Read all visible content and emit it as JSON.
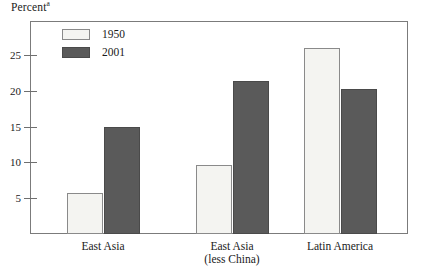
{
  "chart_data": {
    "type": "bar",
    "title": "",
    "ylabel": "Percent",
    "ylabel_superscript": "a",
    "xlabel": "",
    "categories": [
      "East Asia",
      "East Asia (less China)",
      "Latin America"
    ],
    "category_lines": [
      [
        "East Asia"
      ],
      [
        "East Asia",
        "(less China)"
      ],
      [
        "Latin America"
      ]
    ],
    "series": [
      {
        "name": "1950",
        "color": "#f4f4f1",
        "values": [
          5.7,
          9.6,
          26.0
        ]
      },
      {
        "name": "2001",
        "color": "#5a5a5a",
        "values": [
          15.0,
          21.3,
          20.3
        ]
      }
    ],
    "ylim": [
      0,
      28.4
    ],
    "yticks": [
      5,
      10,
      15,
      20,
      25
    ],
    "ytick_labels": [
      "5",
      "10",
      "15",
      "20",
      "25"
    ],
    "grid": false,
    "legend_position": "top-left-inside",
    "frame": true
  },
  "legend": {
    "items": [
      {
        "label": "1950",
        "swatch": "light"
      },
      {
        "label": "2001",
        "swatch": "dark"
      }
    ]
  },
  "axis": {
    "y_title": "Percent",
    "y_title_superscript": "a"
  }
}
